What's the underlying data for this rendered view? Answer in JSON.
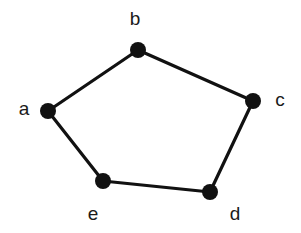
{
  "figure": {
    "name": "undirected-graph-five-cycle",
    "background_color": "#ffffff",
    "width": 301,
    "height": 233
  },
  "style": {
    "node_color": "#111111",
    "node_radius": 8,
    "edge_color": "#111111",
    "edge_width": 3.2,
    "label_color": "#1a1a1a",
    "label_font_size": 19
  },
  "chart_data": {
    "type": "diagram",
    "subtype": "undirected-graph",
    "title": "",
    "xlabel": "",
    "ylabel": "",
    "grid": false,
    "legend": null,
    "node_count": 5,
    "edge_count": 5,
    "nodes": [
      {
        "id": "a",
        "label": "a",
        "x": 48,
        "y": 111,
        "label_x": 24,
        "label_y": 108
      },
      {
        "id": "b",
        "label": "b",
        "x": 138,
        "y": 50,
        "label_x": 135,
        "label_y": 18
      },
      {
        "id": "c",
        "label": "c",
        "x": 253,
        "y": 101,
        "label_x": 280,
        "label_y": 99
      },
      {
        "id": "d",
        "label": "d",
        "x": 210,
        "y": 192,
        "label_x": 235,
        "label_y": 213
      },
      {
        "id": "e",
        "label": "e",
        "x": 103,
        "y": 181,
        "label_x": 93,
        "label_y": 213
      }
    ],
    "edges": [
      {
        "source": "a",
        "target": "b"
      },
      {
        "source": "b",
        "target": "c"
      },
      {
        "source": "c",
        "target": "d"
      },
      {
        "source": "d",
        "target": "e"
      },
      {
        "source": "e",
        "target": "a"
      }
    ]
  }
}
